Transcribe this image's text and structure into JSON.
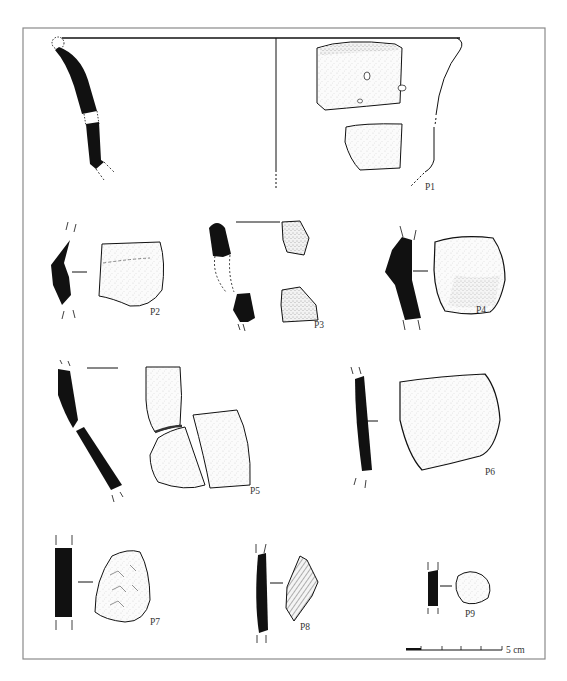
{
  "figure": {
    "type": "archaeological pottery sherd plate",
    "frame_color": "#8a8a8a",
    "ink_color": "#111111",
    "background": "#ffffff"
  },
  "sherds": [
    {
      "id": "P1",
      "label": "P1",
      "description": "rim and body profile with exterior and interior views"
    },
    {
      "id": "P2",
      "label": "P2"
    },
    {
      "id": "P3",
      "label": "P3"
    },
    {
      "id": "P4",
      "label": "P4"
    },
    {
      "id": "P5",
      "label": "P5"
    },
    {
      "id": "P6",
      "label": "P6"
    },
    {
      "id": "P7",
      "label": "P7"
    },
    {
      "id": "P8",
      "label": "P8"
    },
    {
      "id": "P9",
      "label": "P9"
    }
  ],
  "scale_bar": {
    "label": "5 cm",
    "divisions": 5
  }
}
